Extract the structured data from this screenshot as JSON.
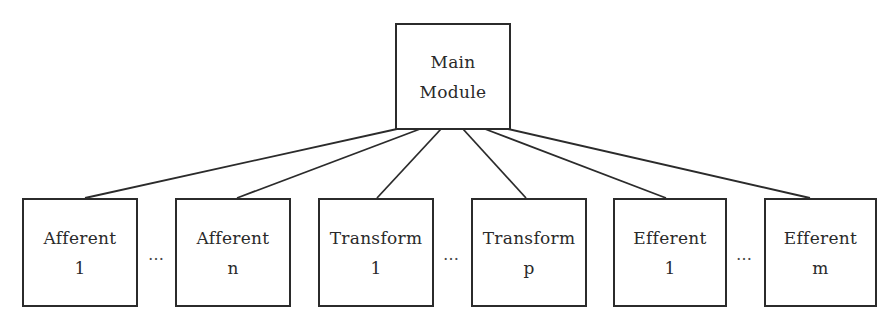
{
  "diagram": {
    "type": "module-hierarchy",
    "root": {
      "id": "main",
      "lines": [
        "Main",
        "Module"
      ]
    },
    "children": [
      {
        "id": "afferent-1",
        "lines": [
          "Afferent",
          "1"
        ]
      },
      {
        "id": "afferent-n",
        "lines": [
          "Afferent",
          "n"
        ]
      },
      {
        "id": "transform-1",
        "lines": [
          "Transform",
          "1"
        ]
      },
      {
        "id": "transform-p",
        "lines": [
          "Transform",
          "p"
        ]
      },
      {
        "id": "efferent-1",
        "lines": [
          "Efferent",
          "1"
        ]
      },
      {
        "id": "efferent-m",
        "lines": [
          "Efferent",
          "m"
        ]
      }
    ],
    "ellipsis": "…",
    "edges": [
      [
        "main",
        "afferent-1"
      ],
      [
        "main",
        "afferent-n"
      ],
      [
        "main",
        "transform-1"
      ],
      [
        "main",
        "transform-p"
      ],
      [
        "main",
        "efferent-1"
      ],
      [
        "main",
        "efferent-m"
      ]
    ]
  }
}
